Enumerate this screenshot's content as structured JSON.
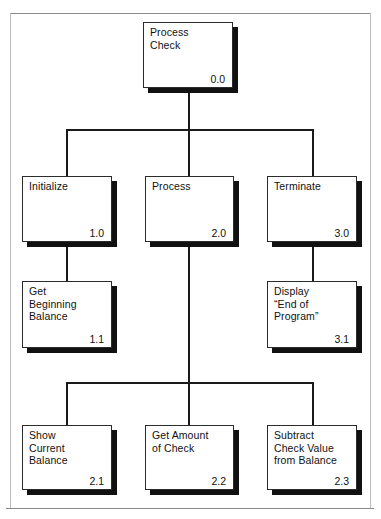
{
  "diagram": {
    "colors": {
      "box_border": "#2b2b2b",
      "box_fill": "#ffffff",
      "shadow": "#111111",
      "connector": "#1a1a1a",
      "page_rule": "#8a8a8a"
    },
    "modules": [
      {
        "id": "root",
        "label": "Process\nCheck",
        "number": "0.0"
      },
      {
        "id": "init",
        "label": "Initialize",
        "number": "1.0"
      },
      {
        "id": "process",
        "label": "Process",
        "number": "2.0"
      },
      {
        "id": "terminate",
        "label": "Terminate",
        "number": "3.0"
      },
      {
        "id": "getbeg",
        "label": "Get\nBeginning\nBalance",
        "number": "1.1"
      },
      {
        "id": "display",
        "label": "Display\n“End of\nProgram”",
        "number": "3.1"
      },
      {
        "id": "showcur",
        "label": "Show\nCurrent\nBalance",
        "number": "2.1"
      },
      {
        "id": "getamt",
        "label": "Get Amount\nof Check",
        "number": "2.2"
      },
      {
        "id": "subtract",
        "label": "Subtract\nCheck Value\nfrom Balance",
        "number": "2.3"
      }
    ]
  }
}
